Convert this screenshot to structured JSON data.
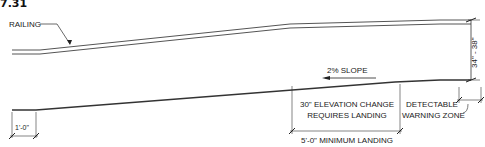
{
  "figure": {
    "number": "7.31"
  },
  "labels": {
    "railing": "RAILING",
    "slope": "2% SLOPE",
    "height": "34\" - 38\"",
    "elevation_line1": "30\" ELEVATION CHANGE",
    "elevation_line2": "REQUIRES LANDING",
    "landing": "5'-0\" MINIMUM LANDING",
    "warning_line1": "DETECTABLE",
    "warning_line2": "WARNING ZONE",
    "edge_dim": "1'-0\""
  },
  "colors": {
    "line": "#333333",
    "rail": "#555555",
    "text": "#222222"
  }
}
